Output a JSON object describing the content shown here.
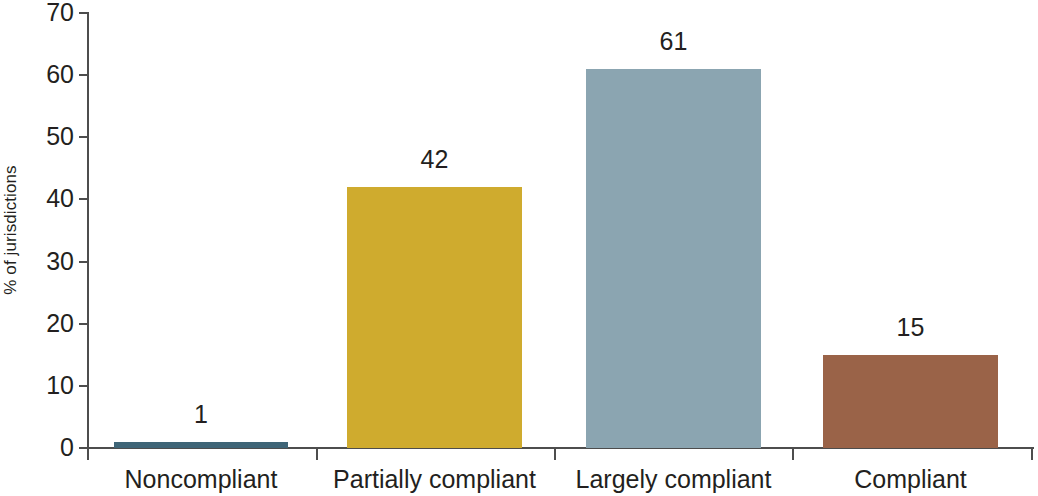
{
  "chart_data": {
    "type": "bar",
    "title": "",
    "subtitle": "",
    "xlabel": "",
    "ylabel": "% of jurisdictions",
    "categories": [
      "Noncompliant",
      "Partially compliant",
      "Largely compliant",
      "Compliant"
    ],
    "values": [
      1,
      42,
      61,
      15
    ],
    "value_labels": [
      "1",
      "42",
      "61",
      "15"
    ],
    "bar_colors": [
      "#3f6577",
      "#cfab2e",
      "#8ba5b1",
      "#9a6348"
    ],
    "ylim": [
      0,
      70
    ],
    "ytick_labels": [
      "0",
      "10",
      "20",
      "30",
      "40",
      "50",
      "60",
      "70"
    ],
    "ytick_values": [
      0,
      10,
      20,
      30,
      40,
      50,
      60,
      70
    ],
    "grid": false,
    "legend": false,
    "legend_position": "none",
    "axis_color": "#4d4d4d",
    "text_color": "#231f20",
    "background": "#ffffff"
  }
}
